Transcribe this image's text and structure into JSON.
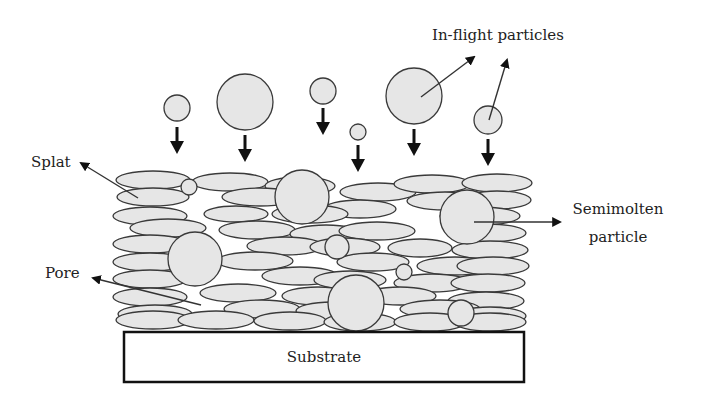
{
  "diagram": {
    "labels": {
      "in_flight": "In-flight particles",
      "splat": "Splat",
      "pore": "Pore",
      "semimolten_line1": "Semimolten",
      "semimolten_line2": "particle",
      "substrate": "Substrate"
    },
    "colors": {
      "fill": "#e6e6e6",
      "stroke": "#3a3a3a",
      "arrow": "#111111",
      "background": "#ffffff"
    },
    "in_flight_particles": [
      {
        "cx": 177,
        "cy": 108,
        "r": 13
      },
      {
        "cx": 245,
        "cy": 102,
        "r": 28
      },
      {
        "cx": 323,
        "cy": 91,
        "r": 13
      },
      {
        "cx": 358,
        "cy": 132,
        "r": 8
      },
      {
        "cx": 414,
        "cy": 96,
        "r": 28
      },
      {
        "cx": 488,
        "cy": 120,
        "r": 14
      }
    ],
    "fall_arrows": [
      {
        "x": 177,
        "y1": 127,
        "y2": 152
      },
      {
        "x": 245,
        "y1": 135,
        "y2": 160
      },
      {
        "x": 323,
        "y1": 108,
        "y2": 134
      },
      {
        "x": 358,
        "y1": 145,
        "y2": 171
      },
      {
        "x": 414,
        "y1": 129,
        "y2": 155
      },
      {
        "x": 488,
        "y1": 139,
        "y2": 165
      }
    ]
  }
}
